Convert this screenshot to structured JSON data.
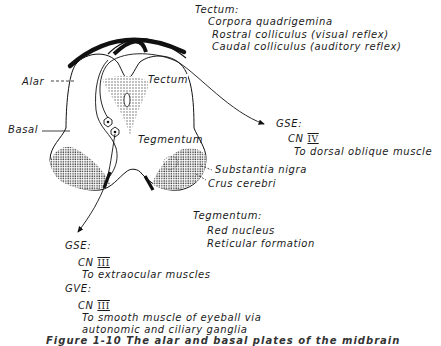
{
  "diagram": {
    "structure_labels": {
      "alar": "Alar",
      "basal": "Basal",
      "tectum": "Tectum",
      "tegmentum": "Tegmentum",
      "substantia_nigra": "Substantia nigra",
      "crus_cerebri": "Crus cerebri"
    },
    "tectum_note": {
      "heading": "Tectum:",
      "line1": "Corpora quadrigemina",
      "line2": "Rostral colliculus (visual reflex)",
      "line3": "Caudal colliculus (auditory reflex)"
    },
    "gse_right": {
      "heading": "GSE:",
      "nerve_prefix": "CN",
      "nerve_numeral": "IV",
      "target": "To dorsal oblique muscle"
    },
    "tegmentum_note": {
      "heading": "Tegmentum:",
      "line1": "Red nucleus",
      "line2": "Reticular formation"
    },
    "gse_left": {
      "heading": "GSE:",
      "nerve_prefix": "CN",
      "nerve_numeral": "III",
      "target": "To extraocular muscles"
    },
    "gve": {
      "heading": "GVE:",
      "nerve_prefix": "CN",
      "nerve_numeral": "III",
      "line1": "To smooth muscle of eyeball via",
      "line2": "autonomic and ciliary ganglia"
    },
    "caption_partial": "Figure 1-10  The alar and basal plates of the midbrain"
  }
}
